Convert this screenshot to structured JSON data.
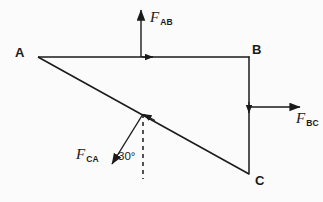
{
  "figure": {
    "type": "free-body-force-triangle-diagram",
    "canvas": {
      "width": 323,
      "height": 202
    },
    "background_color": "#fbfbfb",
    "stroke_color": "#1a1a1a",
    "vertices": [
      {
        "id": "A",
        "label": "A",
        "x": 38,
        "y": 57,
        "label_x": 15,
        "label_y": 46
      },
      {
        "id": "B",
        "label": "B",
        "x": 249,
        "y": 57,
        "label_x": 252,
        "label_y": 43
      },
      {
        "id": "C",
        "label": "C",
        "x": 249,
        "y": 174,
        "label_x": 255,
        "label_y": 174
      }
    ],
    "members": [
      {
        "id": "AB",
        "from": "A",
        "to": "B",
        "style": "solid",
        "arrow_at": {
          "x": 152,
          "y": 57
        },
        "arrow_dir": "right"
      },
      {
        "id": "BC",
        "from": "B",
        "to": "C",
        "style": "solid",
        "arrow_at": {
          "x": 249,
          "y": 114
        },
        "arrow_dir": "down"
      },
      {
        "id": "CA",
        "from": "C",
        "to": "A",
        "style": "solid",
        "arrow_at": {
          "x": 143,
          "y": 113
        },
        "arrow_dir": "up-left"
      }
    ],
    "force_arrows": [
      {
        "id": "F_AB",
        "label": "F",
        "subscript": "AB",
        "tail": {
          "x": 141,
          "y": 57
        },
        "tip": {
          "x": 141,
          "y": 9
        },
        "direction": "up",
        "label_x": 150,
        "label_y": 10
      },
      {
        "id": "F_BC",
        "label": "F",
        "subscript": "BC",
        "tail": {
          "x": 250,
          "y": 107
        },
        "tip": {
          "x": 301,
          "y": 107
        },
        "direction": "right",
        "label_x": 296,
        "label_y": 111
      },
      {
        "id": "F_CA",
        "label": "F",
        "subscript": "CA",
        "tail": {
          "x": 143,
          "y": 114
        },
        "tip": {
          "x": 110,
          "y": 166
        },
        "direction": "down-left",
        "label_x": 76,
        "label_y": 147
      }
    ],
    "reference_line": {
      "id": "vertical-dashed-reference",
      "style": "dashed",
      "from": {
        "x": 143,
        "y": 114
      },
      "to": {
        "x": 143,
        "y": 179
      }
    },
    "angle_annotation": {
      "id": "angle-30",
      "text": "30°",
      "value": 30,
      "unit": "degrees",
      "between": [
        "F_CA",
        "vertical-dashed-reference"
      ],
      "label_x": 118,
      "label_y": 151
    }
  }
}
